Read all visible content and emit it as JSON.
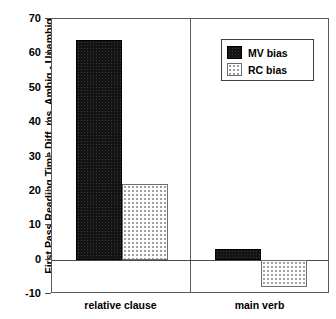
{
  "chart_data": {
    "type": "bar",
    "title": "",
    "xlabel": "",
    "ylabel": "First Pass Reading Time Diff, ms, Ambig - Unambig",
    "categories": [
      "relative clause",
      "main verb"
    ],
    "series": [
      {
        "name": "MV bias",
        "values": [
          64,
          3
        ],
        "color": "#131313",
        "fill": "dark-dotted"
      },
      {
        "name": "RC bias",
        "values": [
          22,
          -8
        ],
        "color": "#fdfdfd",
        "fill": "light-dotted"
      }
    ],
    "ylim": [
      -10,
      70
    ],
    "yticks": [
      -10,
      0,
      10,
      20,
      30,
      40,
      50,
      60,
      70
    ],
    "ytick_labels": [
      "-10",
      "0",
      "10",
      "20",
      "30",
      "40",
      "50",
      "60",
      "70"
    ],
    "grid": false,
    "legend_position": "top-right",
    "zero_line": 0,
    "panel_divider": true
  },
  "legend": {
    "items": [
      {
        "label": "MV bias",
        "swatch": "dark-dotted-swatch"
      },
      {
        "label": "RC bias",
        "swatch": "light-dotted-swatch"
      }
    ]
  }
}
